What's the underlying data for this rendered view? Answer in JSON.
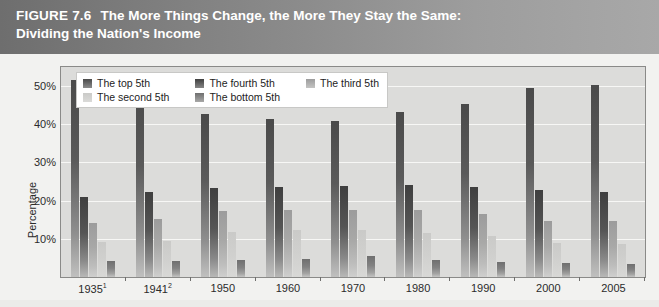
{
  "figure": {
    "label": "FIGURE 7.6",
    "title_line1": "The More Things Change, the More They Stay the Same:",
    "title_line2": "Dividing the Nation's Income"
  },
  "chart_data": {
    "type": "bar",
    "title": "The More Things Change, the More They Stay the Same: Dividing the Nation's Income",
    "xlabel": "",
    "ylabel": "Percentage",
    "ylim": [
      0,
      55
    ],
    "grid": true,
    "legend_position": "top-left",
    "ytick_labels": [
      "50%",
      "40%",
      "30%",
      "20%",
      "10%"
    ],
    "ytick_values": [
      50,
      40,
      30,
      20,
      10
    ],
    "categories": [
      "1935",
      "1941",
      "1950",
      "1960",
      "1970",
      "1980",
      "1990",
      "2000",
      "2005"
    ],
    "category_labels": [
      "1935¹",
      "1941²",
      "1950",
      "1960",
      "1970",
      "1980",
      "1990",
      "2000",
      "2005"
    ],
    "category_footnotes": [
      "1",
      "2",
      "",
      "",
      "",
      "",
      "",
      "",
      ""
    ],
    "series": [
      {
        "name": "The top 5th",
        "color": "#4a4a4a",
        "values": [
          51.7,
          48.8,
          42.7,
          41.3,
          40.9,
          43.3,
          45.2,
          49.6,
          50.4
        ]
      },
      {
        "name": "The fourth 5th",
        "color": "#3f3f3f",
        "values": [
          20.9,
          22.3,
          23.4,
          23.6,
          23.8,
          24.1,
          23.6,
          22.9,
          22.2
        ]
      },
      {
        "name": "The third 5th",
        "color": "#9c9c9c",
        "values": [
          14.1,
          15.3,
          17.4,
          17.6,
          17.6,
          17.5,
          16.5,
          14.8,
          14.6
        ]
      },
      {
        "name": "The second 5th",
        "color": "#cacac8",
        "values": [
          9.2,
          9.5,
          11.9,
          12.2,
          12.2,
          11.6,
          10.7,
          9.0,
          8.6
        ]
      },
      {
        "name": "The bottom 5th",
        "color": "#6f6f6f",
        "values": [
          4.1,
          4.1,
          4.5,
          4.8,
          5.4,
          4.4,
          3.9,
          3.6,
          3.4
        ]
      }
    ]
  }
}
